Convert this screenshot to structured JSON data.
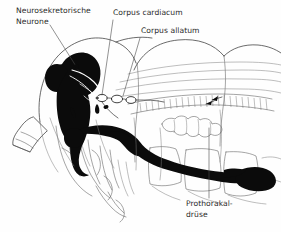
{
  "figure": {
    "language": "de",
    "background_color": "#fefefe",
    "ink_color": "#0b0b0b",
    "line_color": "#3a3a3a",
    "label_color": "#2a2a2a",
    "width": 281,
    "height": 232
  },
  "labels": [
    {
      "id": "neurosekretorische-neurone",
      "line1": "Neurosekretorische",
      "line2": "Neurone",
      "x": 16,
      "y": 13,
      "anchor": "start"
    },
    {
      "id": "corpus-cardiacum",
      "line1": "Corpus cardiacum",
      "line2": "",
      "x": 113,
      "y": 15,
      "anchor": "start"
    },
    {
      "id": "corpus-allatum",
      "line1": "Corpus allatum",
      "line2": "",
      "x": 141,
      "y": 33,
      "anchor": "start"
    },
    {
      "id": "prothorakaldruese",
      "line1": "Prothorakal-",
      "line2": "drüse",
      "x": 186,
      "y": 206,
      "anchor": "start"
    }
  ],
  "leaders": [
    {
      "id": "leader-neurosekretorische-neurone",
      "path": "M 50 25 L 79 71",
      "arrow": true
    },
    {
      "id": "leader-corpus-cardiacum",
      "path": "M 113 20 L 102 96",
      "arrow": false
    },
    {
      "id": "leader-corpus-allatum",
      "path": "M 140 38 L 123 97",
      "arrow": false
    },
    {
      "id": "leader-prothorakaldruese",
      "path": "M 209 198 L 209 128",
      "arrow": false
    }
  ],
  "structures": [
    {
      "id": "brain-protocerebrum",
      "kind": "filled",
      "name": "Gehirn / Protocerebrum"
    },
    {
      "id": "neurosecretory-cell-tracts",
      "kind": "line",
      "name": "Neurosekretorische Bahnen"
    },
    {
      "id": "corpus-cardiacum-organ",
      "kind": "white-organ",
      "name": "Corpus cardiacum"
    },
    {
      "id": "corpus-allatum-organ",
      "kind": "white-organ",
      "name": "Corpus allatum"
    },
    {
      "id": "suboesophageal-ganglion",
      "kind": "filled",
      "name": "Unterschlundganglion"
    },
    {
      "id": "ventral-nerve-cord",
      "kind": "filled",
      "name": "Bauchmark"
    },
    {
      "id": "prothoracic-gland-organ",
      "kind": "filled",
      "name": "Prothorakaldrüse"
    },
    {
      "id": "head-capsule-outline",
      "kind": "line",
      "name": "Kopfkapsel"
    },
    {
      "id": "pharynx-gut-outline",
      "kind": "line",
      "name": "Schlund / Darm"
    },
    {
      "id": "salivary-gland-outline",
      "kind": "line",
      "name": "Speicheldrüse"
    },
    {
      "id": "mouthparts-outline",
      "kind": "line",
      "name": "Mundwerkzeuge"
    },
    {
      "id": "antenna-base-outline",
      "kind": "line",
      "name": "Antennenbasis"
    },
    {
      "id": "thorax-segments-outline",
      "kind": "line",
      "name": "Thoraxsegmente"
    }
  ]
}
